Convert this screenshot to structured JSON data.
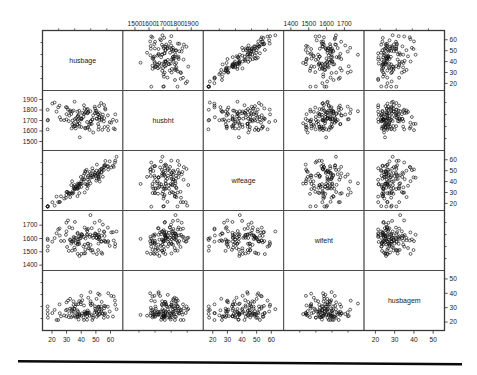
{
  "figure": {
    "type": "scatterplot-matrix",
    "title": "",
    "background": "#ffffff",
    "point_color": "#111111",
    "panel_border_color": "#4a4a4a",
    "marker": "open-circle",
    "n_points": 120,
    "grid": false,
    "legend": "none",
    "bottom_rule": true
  },
  "chart_data": {
    "type": "scatter",
    "title": "",
    "xlabel": "",
    "ylabel": "",
    "matrix": true,
    "variables": [
      {
        "key": "husbage",
        "label": "husbage",
        "unit": "years",
        "range": [
          16,
          66
        ],
        "ticks": [
          20,
          30,
          40,
          50,
          60
        ],
        "tick_labels": [
          "20",
          "30",
          "40",
          "50",
          "60"
        ],
        "axis_bottom": true,
        "axis_top": false,
        "axis_left": false,
        "axis_right": true
      },
      {
        "key": "husbht",
        "label": "husbht",
        "unit": "mm",
        "range": [
          1440,
          1960
        ],
        "ticks": [
          1500,
          1600,
          1700,
          1800,
          1900
        ],
        "tick_labels": [
          "1500",
          "1600",
          "1700",
          "1800",
          "1900"
        ],
        "axis_bottom": false,
        "axis_top": true,
        "axis_left": true,
        "axis_right": false
      },
      {
        "key": "wifeage",
        "label": "wifeage",
        "unit": "years",
        "range": [
          16,
          66
        ],
        "ticks": [
          20,
          30,
          40,
          50,
          60
        ],
        "tick_labels": [
          "20",
          "30",
          "40",
          "50",
          "60"
        ],
        "axis_bottom": true,
        "axis_top": false,
        "axis_left": false,
        "axis_right": true
      },
      {
        "key": "wifeht",
        "label": "wifeht",
        "unit": "mm",
        "range": [
          1380,
          1790
        ],
        "ticks": [
          1400,
          1500,
          1600,
          1700
        ],
        "tick_labels": [
          "1400",
          "1500",
          "1600",
          "1700"
        ],
        "axis_bottom": false,
        "axis_top": true,
        "axis_left": true,
        "axis_right": false
      },
      {
        "key": "husbagem",
        "label": "husbagem",
        "unit": "years",
        "range": [
          16,
          54
        ],
        "ticks": [
          20,
          30,
          40,
          50
        ],
        "tick_labels": [
          "20",
          "30",
          "40",
          "50"
        ],
        "axis_bottom": true,
        "axis_top": false,
        "axis_left": false,
        "axis_right": true
      }
    ],
    "means": {
      "husbage": 41.0,
      "husbht": 1730.0,
      "wifeage": 38.2,
      "wifeht": 1602.0,
      "husbagem": 26.8
    },
    "sds": {
      "husbage": 11.8,
      "husbht": 68.0,
      "wifeage": 11.6,
      "wifeht": 62.0,
      "husbagem": 5.6
    },
    "correlations": {
      "husbage_husbht": -0.22,
      "husbage_wifeage": 0.94,
      "husbage_wifeht": -0.06,
      "husbage_husbagem": 0.25,
      "husbht_wifeage": -0.19,
      "husbht_wifeht": 0.36,
      "husbht_husbagem": -0.05,
      "wifeage_wifeht": -0.1,
      "wifeage_husbagem": 0.23,
      "wifeht_husbagem": -0.08
    }
  },
  "axes_tick_text": {
    "top_col2": [
      "1500",
      "1600",
      "1700",
      "1800",
      "1900"
    ],
    "top_col4": [
      "1400",
      "1500",
      "1600",
      "1700"
    ],
    "left_row2": [
      "1900",
      "1800",
      "1700",
      "1600",
      "1500"
    ],
    "left_row4": [
      "1700",
      "1600",
      "1500"
    ],
    "right_row1": [
      "60",
      "50",
      "40",
      "30",
      "20"
    ],
    "right_row3": [
      "60",
      "50",
      "40",
      "30",
      "20"
    ],
    "right_row5": [
      "50",
      "40",
      "30",
      "20"
    ],
    "bottom_col1": [
      "20",
      "30",
      "40",
      "50",
      "60"
    ],
    "bottom_col3": [
      "20",
      "30",
      "40",
      "50",
      "60"
    ],
    "bottom_col5": [
      "20",
      "30",
      "40",
      "50"
    ]
  }
}
